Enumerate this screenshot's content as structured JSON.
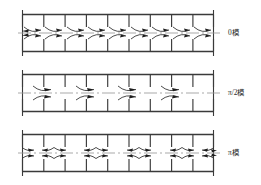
{
  "figure": {
    "type": "mode-shape-diagram",
    "width": 261,
    "height": 185,
    "background": "#ffffff",
    "line_color": "#3a3a3a",
    "arrow_color": "#262626",
    "centerline_color": "#8a8a8a"
  },
  "panels": [
    {
      "id": "panel-0",
      "label": "0模",
      "mode_name": "0",
      "bays": 9,
      "arrow_groups": 9,
      "arrow_pattern": "every-bay",
      "top": 8,
      "frame_left": 22,
      "frame_right": 214,
      "frame_top": 14,
      "frame_bottom": 52,
      "centerline_y": 33,
      "label_x": 228,
      "label_y": 28
    },
    {
      "id": "panel-pi-2",
      "label": "π/2模",
      "mode_name": "π/2",
      "bays": 9,
      "arrow_groups": 4,
      "arrow_pattern": "every-other-bay",
      "top": 68,
      "frame_left": 22,
      "frame_right": 214,
      "frame_top": 74,
      "frame_bottom": 112,
      "centerline_y": 93,
      "label_x": 228,
      "label_y": 88
    },
    {
      "id": "panel-pi",
      "label": "π模",
      "mode_name": "π",
      "bays": 9,
      "arrow_groups": 10,
      "arrow_pattern": "every-node",
      "top": 128,
      "frame_left": 22,
      "frame_right": 214,
      "frame_top": 134,
      "frame_bottom": 172,
      "centerline_y": 153,
      "label_x": 228,
      "label_y": 148
    }
  ],
  "axis_ticks": {
    "left_marker": "bracket",
    "right_marker": "bracket"
  }
}
